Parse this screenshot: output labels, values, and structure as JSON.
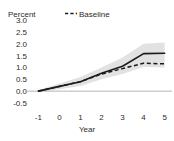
{
  "chart_data": {
    "type": "line",
    "title": "",
    "subtitle": "",
    "xlabel": "Year",
    "ylabel": "Percent",
    "ylabel_position": "top-left",
    "grid": false,
    "zero_line": true,
    "legend_position": "top-center",
    "x": [
      -1,
      0,
      1,
      2,
      3,
      4,
      5
    ],
    "xlim": [
      -1.35,
      5.35
    ],
    "ylim": [
      -0.5,
      3.0
    ],
    "xticks": [
      "-1",
      "0",
      "1",
      "2",
      "3",
      "4",
      "5"
    ],
    "yticks": [
      "3.0",
      "2.5",
      "2.0",
      "1.5",
      "1.0",
      "0.5",
      "0.0",
      "-0.5"
    ],
    "ytick_values": [
      3.0,
      2.5,
      2.0,
      1.5,
      1.0,
      0.5,
      0.0,
      -0.5
    ],
    "series": [
      {
        "name": "Estimate",
        "style": "solid",
        "color": "#1a1a1a",
        "legend_shown": false,
        "values": [
          0.0,
          0.2,
          0.4,
          0.75,
          1.05,
          1.58,
          1.6
        ]
      },
      {
        "name": "Baseline",
        "style": "dashed",
        "color": "#1a1a1a",
        "legend_shown": true,
        "values": [
          0.0,
          0.2,
          0.4,
          0.72,
          0.95,
          1.18,
          1.15
        ]
      }
    ],
    "band": {
      "name": "Confidence interval",
      "color": "#e2e2e2",
      "upper": [
        0.05,
        0.32,
        0.6,
        1.0,
        1.42,
        2.0,
        2.05
      ],
      "lower": [
        -0.05,
        0.08,
        0.22,
        0.5,
        0.72,
        1.02,
        1.0
      ]
    },
    "legend": [
      {
        "label": "Baseline",
        "marker": "dashed-line-marker",
        "color": "#1a1a1a"
      }
    ],
    "colors": {
      "line": "#1a1a1a",
      "band": "#e2e2e2",
      "zero_line": "#b5b5b5",
      "text": "#2b2b2b",
      "background": "#ffffff"
    }
  }
}
